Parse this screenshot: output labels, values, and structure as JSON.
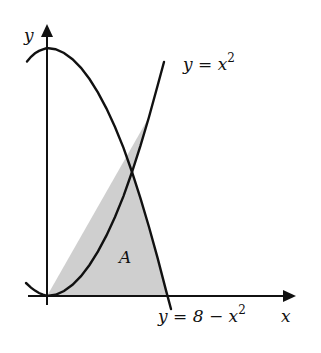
{
  "diagram": {
    "axes": {
      "x_label": "x",
      "y_label": "y"
    },
    "curves": [
      {
        "name": "upward-parabola",
        "equation_lhs": "y = x",
        "equation_exp": "2",
        "label": "y = x^2"
      },
      {
        "name": "downward-parabola",
        "equation_lhs": "y = 8 − x",
        "equation_exp": "2",
        "label": "y = 8 − x^2"
      }
    ],
    "region": {
      "label": "A",
      "fill": "#cfcfcf",
      "description": "Region bounded by y = x^2, y = 8 − x^2 and the x-axis, for x ≥ 0"
    },
    "colors": {
      "stroke": "#111111",
      "background": "#ffffff",
      "shade": "#cfcfcf"
    }
  }
}
